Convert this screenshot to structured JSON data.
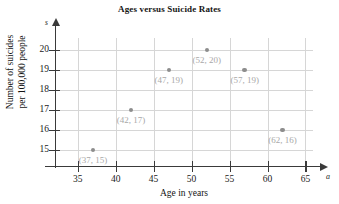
{
  "chart_data": {
    "type": "scatter",
    "title": "Ages versus Suicide Rates",
    "xlabel": "Age in years",
    "ylabel": "Number of suicides per 100,000 people",
    "ylabel_lines": [
      "Number of suicides",
      "per 100,000 people"
    ],
    "x_variable": "a",
    "y_variable": "s",
    "xlim": [
      32,
      66
    ],
    "ylim": [
      14.2,
      20.6
    ],
    "xticks": [
      35,
      40,
      45,
      50,
      55,
      60,
      65
    ],
    "yticks": [
      15,
      16,
      17,
      18,
      19,
      20
    ],
    "grid": true,
    "legend": null,
    "x": [
      37,
      42,
      47,
      52,
      57,
      62
    ],
    "y": [
      15,
      17,
      19,
      20,
      19,
      16
    ],
    "point_labels": [
      "(37, 15)",
      "(42, 17)",
      "(47, 19)",
      "(52, 20)",
      "(57, 19)",
      "(62, 16)"
    ],
    "point_label_placement": [
      "below",
      "below",
      "below",
      "below",
      "below",
      "below"
    ],
    "marker_color": "#8d8d8d",
    "label_color": "#a8a8a8",
    "grid_color": "#d6d6d6",
    "axis_color": "#3a3a3a"
  }
}
